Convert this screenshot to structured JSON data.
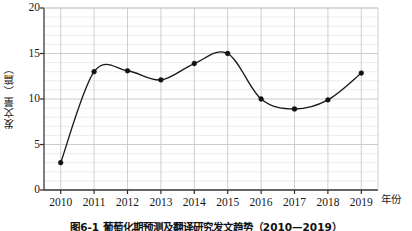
{
  "chart_data": {
    "type": "line",
    "title": "",
    "caption": "图6-1  葡萄化期预测及翻译研究发文趋势（2010—2019）",
    "xlabel": "年份",
    "ylabel": "发文量（篇）",
    "categories": [
      "2010",
      "2011",
      "2012",
      "2013",
      "2014",
      "2015",
      "2016",
      "2017",
      "2018",
      "2019"
    ],
    "x": [
      2010,
      2011,
      2012,
      2013,
      2014,
      2015,
      2016,
      2017,
      2018,
      2019
    ],
    "values": [
      3,
      13,
      13.1,
      12.1,
      13.9,
      15,
      10,
      8.9,
      9.9,
      12.85
    ],
    "series": [
      {
        "name": "发文量",
        "values": [
          3,
          13,
          13.1,
          12.1,
          13.9,
          15,
          10,
          8.9,
          9.9,
          12.85
        ]
      }
    ],
    "ylim": [
      0,
      20
    ],
    "xlim": [
      2009.5,
      2019.5
    ],
    "ytick_labels": [
      "0",
      "5",
      "10",
      "15",
      "20"
    ],
    "ytick_values": [
      0,
      5,
      10,
      15,
      20
    ],
    "y_minor_step": 1,
    "grid": true,
    "grid_color": "#d9d9d9",
    "legend": "none",
    "line_color": "#1a1a1a",
    "marker": "circle",
    "marker_color": "#111111",
    "smoothing": "spline"
  }
}
